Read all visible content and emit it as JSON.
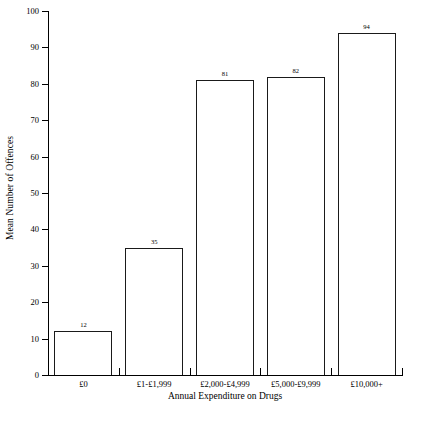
{
  "chart_data": {
    "type": "bar",
    "title": "",
    "xlabel": "Annual Expenditure on Drugs",
    "ylabel": "Mean Number of Offences",
    "categories": [
      "£0",
      "£1-£1,999",
      "£2,000-£4,999",
      "£5,000-£9,999",
      "£10,000+"
    ],
    "values": [
      12,
      35,
      81,
      82,
      94
    ],
    "value_labels": [
      "12",
      "35",
      "81",
      "82",
      "94"
    ],
    "ylim": [
      0,
      100
    ],
    "ytick_labels": [
      "0",
      "10",
      "20",
      "30",
      "40",
      "50",
      "60",
      "70",
      "80",
      "90",
      "100"
    ],
    "ytick_values": [
      0,
      10,
      20,
      30,
      40,
      50,
      60,
      70,
      80,
      90,
      100
    ],
    "grid": false,
    "legend": false,
    "legend_position": "none",
    "bar_fill_color": "#ffffff",
    "bar_edge_color": "#1a1a1a",
    "axis_color": "#000000",
    "background_color": "#ffffff"
  }
}
